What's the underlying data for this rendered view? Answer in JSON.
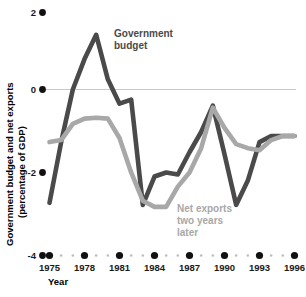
{
  "chart_data": {
    "type": "line",
    "title": "",
    "xlabel": "Year",
    "ylabel": "Government budget and net exports (percentage of GDP)",
    "ylabel_line1": "Government budget and net exports",
    "ylabel_line2": "(percentage of GDP)",
    "xlim": [
      1975,
      1996
    ],
    "ylim": [
      -4,
      2
    ],
    "ytick_labels": [
      "2",
      "0",
      "-2",
      "-4"
    ],
    "ytick_values": [
      2,
      0,
      -2,
      -4
    ],
    "xtick_labels": [
      "1975",
      "1978",
      "1981",
      "1984",
      "1987",
      "1990",
      "1993",
      "1996"
    ],
    "xtick_values": [
      1975,
      1978,
      1981,
      1984,
      1987,
      1990,
      1993,
      1996
    ],
    "x": [
      1975,
      1976,
      1977,
      1978,
      1979,
      1980,
      1981,
      1982,
      1983,
      1984,
      1985,
      1986,
      1987,
      1988,
      1989,
      1990,
      1991,
      1992,
      1993,
      1994,
      1995,
      1996
    ],
    "grid": false,
    "legend_position": "inline-annotations",
    "zero_line": true,
    "series": [
      {
        "name": "Government budget",
        "color": "#4a4a4a",
        "label_line1": "Government",
        "label_line2": "budget",
        "values": [
          -2.7,
          -1.2,
          0.1,
          0.85,
          1.45,
          0.35,
          -0.25,
          -0.15,
          -2.75,
          -2.05,
          -1.95,
          -2.0,
          -1.45,
          -0.95,
          -0.3,
          -1.5,
          -2.75,
          -2.15,
          -1.2,
          -1.05,
          -1.05,
          -1.05
        ]
      },
      {
        "name": "Net exports two years later",
        "color": "#a8a8a8",
        "label_line1": "Net exports",
        "label_line2": "two years",
        "label_line3": "later",
        "values": [
          -1.2,
          -1.15,
          -0.75,
          -0.62,
          -0.6,
          -0.62,
          -1.1,
          -1.95,
          -2.65,
          -2.8,
          -2.8,
          -2.3,
          -1.95,
          -1.35,
          -0.35,
          -0.85,
          -1.25,
          -1.35,
          -1.4,
          -1.15,
          -1.05,
          -1.05
        ]
      }
    ]
  }
}
